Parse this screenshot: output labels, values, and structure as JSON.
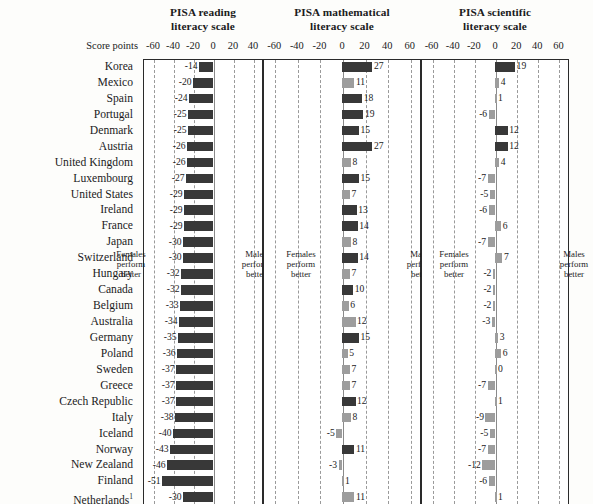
{
  "row_header": "Score points",
  "annotations": {
    "females": [
      "Females",
      "perform",
      "better"
    ],
    "males": [
      "Males",
      "perform",
      "better"
    ]
  },
  "countries": [
    "Korea",
    "Mexico",
    "Spain",
    "Portugal",
    "Denmark",
    "Austria",
    "United Kingdom",
    "Luxembourg",
    "United States",
    "Ireland",
    "France",
    "Japan",
    "Switzerland",
    "Hungary",
    "Canada",
    "Belgium",
    "Australia",
    "Germany",
    "Poland",
    "Sweden",
    "Greece",
    "Czech Republic",
    "Italy",
    "Iceland",
    "Norway",
    "New Zealand",
    "Finland",
    "Netherlands"
  ],
  "netherlands_footnote": "1",
  "colors": {
    "significant": "#383838",
    "not_significant": "#9d9d9d",
    "frame": "#2a2a2a",
    "grid": "#9a9a9a"
  },
  "chart_data": [
    {
      "type": "bar",
      "title": "PISA reading literacy scale",
      "title_lines": [
        "PISA reading",
        "literacy scale"
      ],
      "xlabel": "Score points",
      "ylabel": "",
      "xlim": [
        -70,
        50
      ],
      "ticks": [
        -60,
        -40,
        -20,
        0,
        20,
        40
      ],
      "tick_labels": [
        "-60",
        "-40",
        "-20",
        "0",
        "20",
        "40"
      ],
      "grid": true,
      "categories": [
        "Korea",
        "Mexico",
        "Spain",
        "Portugal",
        "Denmark",
        "Austria",
        "United Kingdom",
        "Luxembourg",
        "United States",
        "Ireland",
        "France",
        "Japan",
        "Switzerland",
        "Hungary",
        "Canada",
        "Belgium",
        "Australia",
        "Germany",
        "Poland",
        "Sweden",
        "Greece",
        "Czech Republic",
        "Italy",
        "Iceland",
        "Norway",
        "New Zealand",
        "Finland",
        "Netherlands"
      ],
      "values": [
        -14,
        -20,
        -24,
        -25,
        -25,
        -26,
        -26,
        -27,
        -29,
        -29,
        -29,
        -30,
        -30,
        -32,
        -32,
        -33,
        -34,
        -35,
        -36,
        -37,
        -37,
        -37,
        -38,
        -40,
        -43,
        -46,
        -51,
        -30
      ],
      "significant": [
        true,
        true,
        true,
        true,
        true,
        true,
        true,
        true,
        true,
        true,
        true,
        true,
        true,
        true,
        true,
        true,
        true,
        true,
        true,
        true,
        true,
        true,
        true,
        true,
        true,
        true,
        true,
        true
      ]
    },
    {
      "type": "bar",
      "title": "PISA mathematical literacy scale",
      "title_lines": [
        "PISA mathematical",
        "literacy scale"
      ],
      "xlabel": "Score points",
      "ylabel": "",
      "xlim": [
        -70,
        70
      ],
      "ticks": [
        -60,
        -40,
        -20,
        0,
        20,
        40,
        60
      ],
      "tick_labels": [
        "-60",
        "-40",
        "-20",
        "0",
        "20",
        "40",
        "60"
      ],
      "grid": true,
      "categories": [
        "Korea",
        "Mexico",
        "Spain",
        "Portugal",
        "Denmark",
        "Austria",
        "United Kingdom",
        "Luxembourg",
        "United States",
        "Ireland",
        "France",
        "Japan",
        "Switzerland",
        "Hungary",
        "Canada",
        "Belgium",
        "Australia",
        "Germany",
        "Poland",
        "Sweden",
        "Greece",
        "Czech Republic",
        "Italy",
        "Iceland",
        "Norway",
        "New Zealand",
        "Finland",
        "Netherlands"
      ],
      "values": [
        27,
        11,
        18,
        19,
        15,
        27,
        8,
        15,
        7,
        13,
        14,
        8,
        14,
        7,
        10,
        6,
        12,
        15,
        5,
        7,
        7,
        12,
        8,
        -5,
        11,
        -3,
        1,
        11
      ],
      "significant": [
        true,
        false,
        true,
        true,
        true,
        true,
        false,
        true,
        false,
        true,
        true,
        false,
        true,
        false,
        true,
        false,
        false,
        true,
        false,
        false,
        false,
        true,
        false,
        false,
        true,
        false,
        false,
        false
      ]
    },
    {
      "type": "bar",
      "title": "PISA scientific literacy scale",
      "title_lines": [
        "PISA scientific",
        "literacy scale"
      ],
      "xlabel": "Score points",
      "ylabel": "",
      "xlim": [
        -70,
        70
      ],
      "ticks": [
        -60,
        -40,
        -20,
        0,
        20,
        40,
        60
      ],
      "tick_labels": [
        "-60",
        "-40",
        "-20",
        "0",
        "20",
        "40",
        "60"
      ],
      "grid": true,
      "categories": [
        "Korea",
        "Mexico",
        "Spain",
        "Portugal",
        "Denmark",
        "Austria",
        "United Kingdom",
        "Luxembourg",
        "United States",
        "Ireland",
        "France",
        "Japan",
        "Switzerland",
        "Hungary",
        "Canada",
        "Belgium",
        "Australia",
        "Germany",
        "Poland",
        "Sweden",
        "Greece",
        "Czech Republic",
        "Italy",
        "Iceland",
        "Norway",
        "New Zealand",
        "Finland",
        "Netherlands"
      ],
      "values": [
        19,
        4,
        1,
        -6,
        12,
        12,
        4,
        -7,
        -5,
        -6,
        6,
        -7,
        7,
        -2,
        -2,
        -2,
        -3,
        3,
        6,
        0,
        -7,
        1,
        -9,
        -5,
        -7,
        -12,
        -6,
        1
      ],
      "significant": [
        true,
        false,
        false,
        false,
        true,
        true,
        false,
        false,
        false,
        false,
        false,
        false,
        false,
        false,
        false,
        false,
        false,
        false,
        false,
        false,
        false,
        false,
        false,
        false,
        false,
        false,
        false,
        false
      ]
    }
  ]
}
